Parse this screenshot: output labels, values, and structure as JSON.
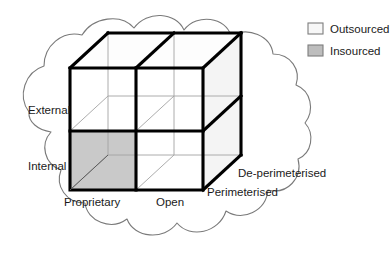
{
  "diagram": {
    "shape": "cloud",
    "colors": {
      "outline": "#7a7a7a",
      "cube_edge": "#000000",
      "cube_inner_line": "#9a9a9a",
      "insourced_fill": "#c9c9c9",
      "outsourced_fill": "#ffffff",
      "tint_fill": "#ececec",
      "text": "#1a1a1a",
      "background": "#ffffff"
    }
  },
  "axes": {
    "vertical": {
      "name": "sourcing-location-axis",
      "labels": [
        {
          "id": "external",
          "text": "External"
        },
        {
          "id": "internal",
          "text": "Internal"
        }
      ]
    },
    "horizontal": {
      "name": "technology-openness-axis",
      "labels": [
        {
          "id": "proprietary",
          "text": "Proprietary"
        },
        {
          "id": "open",
          "text": "Open"
        }
      ]
    },
    "depth": {
      "name": "perimeter-axis",
      "labels": [
        {
          "id": "perimeterised",
          "text": "Perimeterised"
        },
        {
          "id": "de-perimeterised",
          "text": "De-perimeterised"
        }
      ]
    }
  },
  "legend": {
    "name": "sourcing-legend",
    "items": [
      {
        "id": "outsourced",
        "label": "Outsourced",
        "swatch": "#f7f7f7"
      },
      {
        "id": "insourced",
        "label": "Insourced",
        "swatch": "#bdbdbd"
      }
    ]
  }
}
